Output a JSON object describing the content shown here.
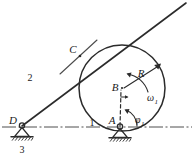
{
  "figure": {
    "type": "kinematic-mechanism-diagram",
    "background_color": "#ffffff",
    "line_color": "#2b2b2b"
  },
  "points": {
    "A": {
      "label": "A",
      "x": 120,
      "y": 127,
      "role": "fixed-pivot-on-centerline"
    },
    "B": {
      "label": "B",
      "x": 122,
      "y": 88,
      "role": "disc-center"
    },
    "C": {
      "label": "C",
      "x": 78,
      "y": 55,
      "role": "tangent-contact-point"
    },
    "D": {
      "label": "D",
      "x": 22,
      "y": 126,
      "role": "fixed-pivot-left"
    }
  },
  "links": {
    "link1": {
      "label": "1",
      "x": 92,
      "y": 123,
      "meaning": "crank-AB"
    },
    "link2": {
      "label": "2",
      "x": 30,
      "y": 78,
      "meaning": "rocker-DC"
    },
    "link3": {
      "label": "3",
      "x": 28,
      "y": 150,
      "meaning": "ground-frame"
    }
  },
  "annotations": {
    "radius": {
      "label": "R",
      "x": 143,
      "y": 76,
      "meaning": "disc radius"
    },
    "omega": {
      "base": "ω",
      "sub": "1",
      "x": 152,
      "y": 98,
      "meaning": "angular velocity of link 1"
    },
    "phi": {
      "base": "φ",
      "sub": "1",
      "x": 140,
      "y": 119,
      "meaning": "crank angle of link 1"
    }
  },
  "circle": {
    "center_x": 122,
    "center_y": 88,
    "radius": 43
  },
  "centerline": {
    "y": 127,
    "x_start": 2,
    "x_end": 192,
    "style": "dash-dot"
  },
  "tangent_line": {
    "from_x": 22,
    "from_y": 126,
    "to_x": 186,
    "to_y": 3
  }
}
